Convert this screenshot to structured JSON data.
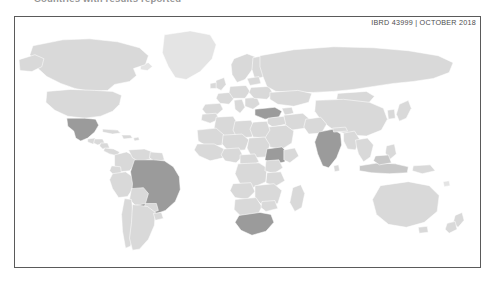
{
  "page": {
    "title": "Countries with results reported",
    "background_color": "#ffffff"
  },
  "map": {
    "credit": "IBRD 43999  |  OCTOBER 2018",
    "frame_border_color": "#5a5a5a",
    "colors": {
      "highlight": "#9b9b9b",
      "plain": "#d9d9d9",
      "faint": "#e4e4e4",
      "semi": "#c8c8c8",
      "border": "#ffffff"
    },
    "projection": "world",
    "highlighted_countries": [
      "Mexico",
      "Brazil",
      "Turkey",
      "Ethiopia",
      "South Africa",
      "India",
      "Indonesia"
    ],
    "legend_present": false
  }
}
